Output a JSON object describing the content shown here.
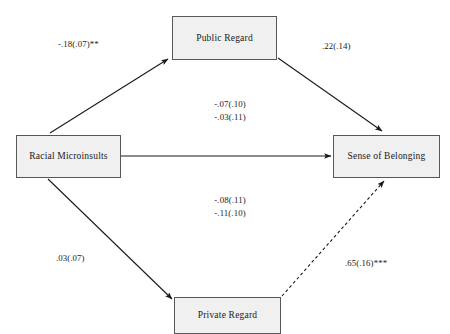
{
  "diagram": {
    "type": "path-diagram",
    "nodes": [
      {
        "id": "racial_microinsults",
        "label": "Racial Microinsults"
      },
      {
        "id": "public_regard",
        "label": "Public Regard"
      },
      {
        "id": "sense_of_belonging",
        "label": "Sense of Belonging"
      },
      {
        "id": "private_regard",
        "label": "Private Regard"
      }
    ],
    "paths": [
      {
        "id": "rm_to_public",
        "from": "Racial Microinsults",
        "to": "Public Regard",
        "style": "solid",
        "coefficient": "-.18(.07)**"
      },
      {
        "id": "public_to_belonging",
        "from": "Public Regard",
        "to": "Sense of Belonging",
        "style": "solid",
        "coefficient": ".22(.14)"
      },
      {
        "id": "rm_to_belonging_direct",
        "from": "Racial Microinsults",
        "to": "Sense of Belonging",
        "style": "solid",
        "coefficient_upper_1": "-.07(.10)",
        "coefficient_upper_2": "-.03(.11)",
        "coefficient_lower_1": "-.08(.11)",
        "coefficient_lower_2": "-.11(.10)"
      },
      {
        "id": "rm_to_private",
        "from": "Racial Microinsults",
        "to": "Private Regard",
        "style": "solid",
        "coefficient": ".03(.07)"
      },
      {
        "id": "private_to_belonging",
        "from": "Private Regard",
        "to": "Sense of Belonging",
        "style": "dashed",
        "coefficient": ".65(.16)***"
      }
    ],
    "colors": {
      "box_fill": "#f0f0f0",
      "box_border": "#575757",
      "line": "#1a1a1a",
      "text": "#1a1a1a",
      "background": "#ffffff"
    }
  }
}
